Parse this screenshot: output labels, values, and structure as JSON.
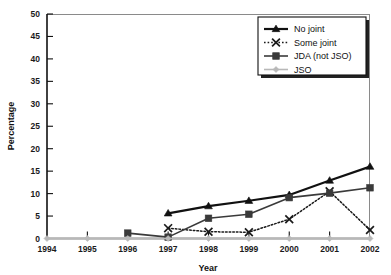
{
  "chart_data": {
    "type": "line",
    "title": "",
    "xlabel": "Year",
    "ylabel": "Percentage",
    "x": [
      1994,
      1995,
      1996,
      1997,
      1998,
      1999,
      2000,
      2001,
      2002
    ],
    "xtick_labels": [
      "1994",
      "1995",
      "1996",
      "1997",
      "1998",
      "1999",
      "2000",
      "2001",
      "2002"
    ],
    "ytick_labels": [
      "0",
      "5",
      "10",
      "15",
      "20",
      "25",
      "30",
      "35",
      "40",
      "45",
      "50"
    ],
    "ytick_values": [
      0,
      5,
      10,
      15,
      20,
      25,
      30,
      35,
      40,
      45,
      50
    ],
    "xlim": [
      1994,
      2002
    ],
    "ylim": [
      0,
      50
    ],
    "grid": false,
    "legend_position": "top-right",
    "series": [
      {
        "name": "No joint",
        "marker": "triangle",
        "line_style": "solid",
        "color": "#111111",
        "x": [
          1997,
          1998,
          1999,
          2000,
          2001,
          2002
        ],
        "values": [
          5.6,
          7.2,
          8.4,
          9.7,
          12.9,
          16.0
        ]
      },
      {
        "name": "Some joint",
        "marker": "x",
        "line_style": "dotted",
        "color": "#1a1a1a",
        "x": [
          1997,
          1998,
          1999,
          2000,
          2001,
          2002
        ],
        "values": [
          2.3,
          1.5,
          1.4,
          4.3,
          10.5,
          1.9
        ]
      },
      {
        "name": "JDA (not JSO)",
        "marker": "square",
        "line_style": "solid",
        "color": "#3a3a3a",
        "x": [
          1996,
          1997,
          1998,
          1999,
          2000,
          2001,
          2002
        ],
        "values": [
          1.2,
          0.3,
          4.5,
          5.4,
          9.1,
          10.1,
          11.3
        ]
      },
      {
        "name": "JSO",
        "marker": "diamond",
        "line_style": "solid",
        "color": "#b8b8b8",
        "x": [
          1994,
          1995,
          1996,
          1997,
          1998,
          1999,
          2000,
          2001,
          2002
        ],
        "values": [
          0,
          0,
          0,
          0,
          0,
          0,
          0,
          0,
          0
        ]
      }
    ]
  }
}
